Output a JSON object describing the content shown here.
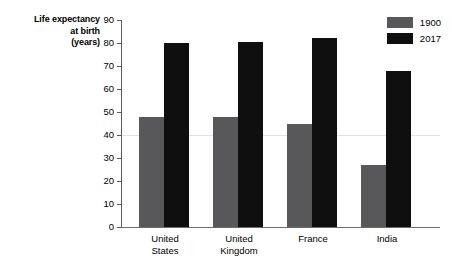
{
  "chart_data": {
    "type": "bar",
    "title": "Life expectancy at birth (years)",
    "ylabel_lines": [
      "Life expectancy",
      "at birth",
      "(years)"
    ],
    "xlabel": "",
    "ylabel": "Life expectancy at birth (years)",
    "categories": [
      "United States",
      "United Kingdom",
      "France",
      "India"
    ],
    "category_lines": [
      [
        "United",
        "States"
      ],
      [
        "United",
        "Kingdom"
      ],
      [
        "France",
        ""
      ],
      [
        "India",
        ""
      ]
    ],
    "series": [
      {
        "name": "1900",
        "color": "#58585a",
        "values": [
          48,
          48,
          45,
          27
        ]
      },
      {
        "name": "2017",
        "color": "#100f10",
        "values": [
          80,
          80.5,
          82,
          68
        ]
      }
    ],
    "ylim": [
      0,
      90
    ],
    "ytick_step": 10,
    "yticks": [
      0,
      10,
      20,
      30,
      40,
      50,
      60,
      70,
      80,
      90
    ],
    "ytick_labels": [
      "0",
      "10",
      "20",
      "30",
      "40",
      "50",
      "60",
      "70",
      "80",
      "90"
    ],
    "grid": false,
    "legend_position": "top-right"
  },
  "legend": {
    "entries": [
      {
        "label": "1900",
        "color": "#58585a"
      },
      {
        "label": "2017",
        "color": "#100f10"
      }
    ]
  }
}
